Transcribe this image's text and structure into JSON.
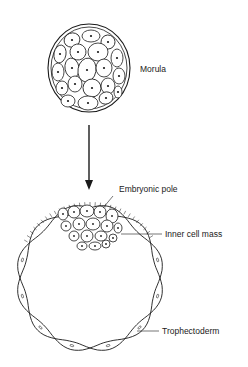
{
  "diagram": {
    "type": "biology-illustration",
    "stages": [
      {
        "name": "morula",
        "label": "Morula"
      },
      {
        "name": "blastocyst",
        "labels": {
          "embryonic_pole": "Embryonic pole",
          "inner_cell_mass": "Inner cell mass",
          "trophectoderm": "Trophectoderm"
        }
      }
    ],
    "transition": "arrow-down"
  },
  "colors": {
    "ink": "#1a1a1a",
    "background": "#ffffff"
  }
}
